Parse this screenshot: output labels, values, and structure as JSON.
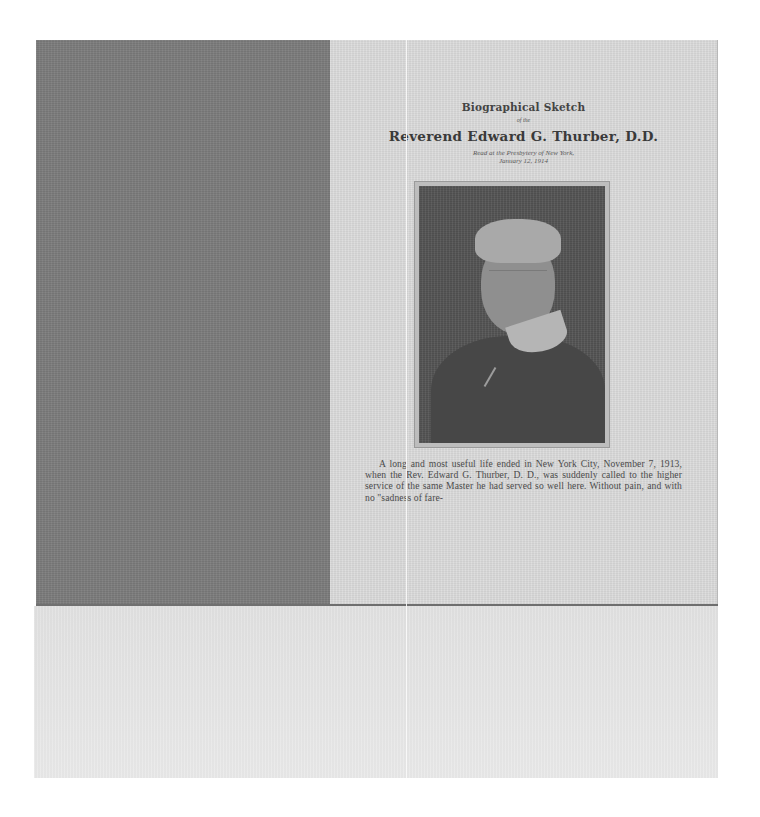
{
  "document": {
    "heading_small": "Biographical Sketch",
    "heading_of": "of the",
    "heading_large": "Reverend Edward G. Thurber, D.D.",
    "subtitle_line1": "Read at the Presbytery of New York,",
    "subtitle_line2": "January 12, 1914",
    "portrait_alt": "Portrait photograph of Reverend Edward G. Thurber",
    "body_paragraph": "A long and most useful life ended in New York City, November 7, 1913, when the Rev. Edward G. Thurber, D. D., was suddenly called to the higher service of the same Master he had served so well here. Without pain, and with no \"sadness of fare-"
  },
  "colors": {
    "left_panel": "#7d7d7d",
    "page_background": "#dcdcdc",
    "lower_area": "#e6e6e6",
    "text": "#3c3c3c",
    "photo": "#555555"
  }
}
